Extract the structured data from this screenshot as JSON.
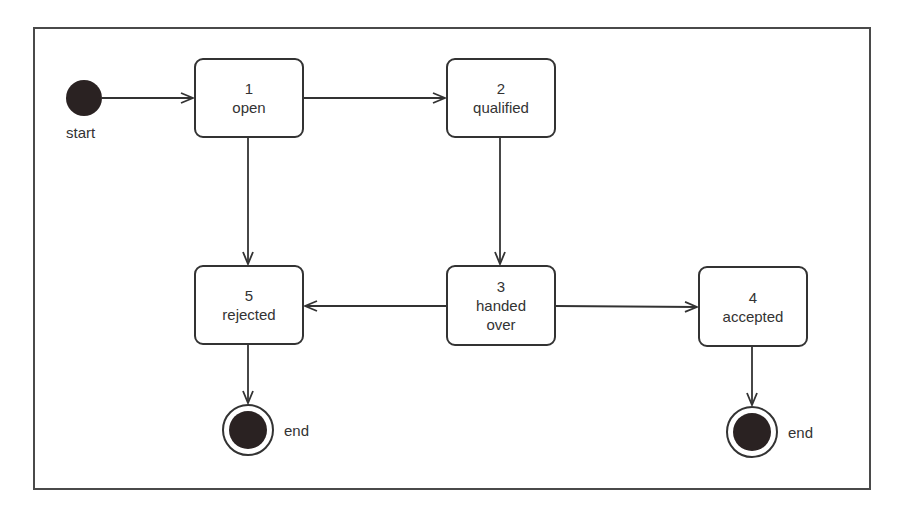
{
  "diagram": {
    "type": "UML state machine",
    "start": {
      "label": "start"
    },
    "states": [
      {
        "id": "open",
        "number": "1",
        "name": "open"
      },
      {
        "id": "qualified",
        "number": "2",
        "name": "qualified"
      },
      {
        "id": "handed_over",
        "number": "3",
        "name_line1": "handed",
        "name_line2": "over"
      },
      {
        "id": "accepted",
        "number": "4",
        "name": "accepted"
      },
      {
        "id": "rejected",
        "number": "5",
        "name": "rejected"
      }
    ],
    "ends": [
      {
        "label": "end"
      },
      {
        "label": "end"
      }
    ],
    "transitions": [
      {
        "from": "start",
        "to": "1 open"
      },
      {
        "from": "1 open",
        "to": "2 qualified"
      },
      {
        "from": "1 open",
        "to": "5 rejected"
      },
      {
        "from": "2 qualified",
        "to": "3 handed over"
      },
      {
        "from": "3 handed over",
        "to": "5 rejected"
      },
      {
        "from": "3 handed over",
        "to": "4 accepted"
      },
      {
        "from": "5 rejected",
        "to": "end"
      },
      {
        "from": "4 accepted",
        "to": "end"
      }
    ],
    "colors": {
      "stroke": "#333333",
      "fill_node": "#2a2222",
      "background": "#ffffff"
    }
  }
}
